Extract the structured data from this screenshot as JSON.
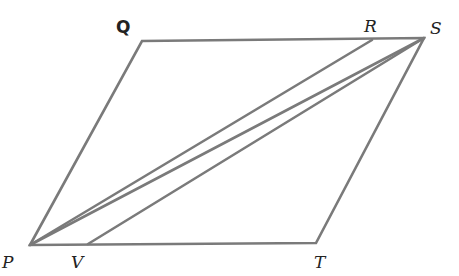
{
  "diagram": {
    "type": "parallelogram",
    "points": {
      "P": [
        30,
        245
      ],
      "V": [
        88,
        244
      ],
      "T": [
        316,
        243
      ],
      "S": [
        424,
        38
      ],
      "R": [
        372,
        40
      ],
      "Q": [
        142,
        41
      ]
    },
    "labels": {
      "Q": "Q",
      "R": "R",
      "S": "S",
      "P": "P",
      "V": "V",
      "T": "T"
    },
    "segments": [
      [
        "P",
        "Q"
      ],
      [
        "Q",
        "S"
      ],
      [
        "S",
        "T"
      ],
      [
        "T",
        "P"
      ],
      [
        "P",
        "R"
      ],
      [
        "V",
        "S"
      ],
      [
        "P",
        "S"
      ]
    ],
    "stroke_color": "#7a7a7a"
  }
}
